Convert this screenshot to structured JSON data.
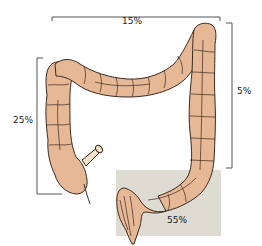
{
  "diagram": {
    "colors": {
      "colon_fill": "#E6B896",
      "colon_outline": "#3A2A20",
      "highlight_box": "#DEDBD2",
      "bracket": "#555555",
      "background": "#FFFFFF"
    },
    "labels": {
      "transverse": "15%",
      "descending": "5%",
      "ascending": "25%",
      "rectosigmoid": "55%"
    }
  }
}
